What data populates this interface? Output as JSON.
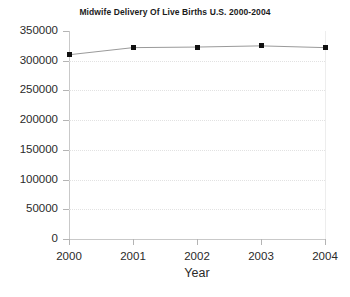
{
  "chart_data": {
    "type": "line",
    "title": "Midwife Delivery Of Live Births U.S. 2000-2004",
    "xlabel": "Year",
    "ylabel": "",
    "categories": [
      "2000",
      "2001",
      "2002",
      "2003",
      "2004"
    ],
    "x": [
      2000,
      2001,
      2002,
      2003,
      2004
    ],
    "values": [
      310000,
      322000,
      323000,
      325000,
      322000
    ],
    "series": [
      {
        "name": "Midwife Delivery Of Live Births",
        "values": [
          310000,
          322000,
          323000,
          325000,
          322000
        ]
      }
    ],
    "ylim": [
      0,
      350000
    ],
    "xlim": [
      2000,
      2004
    ],
    "ytick_labels": [
      "0",
      "50000",
      "100000",
      "150000",
      "200000",
      "250000",
      "300000",
      "350000"
    ],
    "ytick_values": [
      0,
      50000,
      100000,
      150000,
      200000,
      250000,
      300000,
      350000
    ],
    "xtick_labels": [
      "2000",
      "2001",
      "2002",
      "2003",
      "2004"
    ],
    "grid": true,
    "grid_axis": "y",
    "legend": false,
    "legend_position": "none",
    "marker": "square",
    "line_color": "#9a9a9a",
    "marker_color": "#111111",
    "grid_color": "#e2e2e2",
    "axis_color": "#c9c9c9",
    "background_color": "#ffffff",
    "text_color": "#2a2a2a"
  }
}
